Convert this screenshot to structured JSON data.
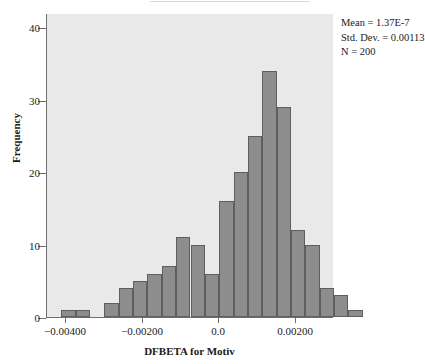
{
  "figure": {
    "top_fragment": "",
    "stats": {
      "mean": "Mean = 1.37E-7",
      "std_dev": "Std. Dev. = 0.00113",
      "n": "N = 200"
    }
  },
  "chart_data": {
    "type": "bar",
    "title": "",
    "subtitle": "",
    "xlabel": "DFBETA for Motiv",
    "ylabel": "Frequency",
    "grid": false,
    "legend": null,
    "plot_background": "#e9e9e9",
    "bar_fill": "#8d8d8d",
    "bar_border": "#5e5e5e",
    "xlim": [
      -0.0045,
      0.003
    ],
    "ylim": [
      0,
      42
    ],
    "xticks": [
      -0.004,
      -0.002,
      0.0,
      0.002
    ],
    "xtick_labels": [
      "−0.00400",
      "−0.00200",
      "0.0",
      "0.00200"
    ],
    "yticks": [
      0,
      10,
      20,
      30,
      40
    ],
    "ytick_labels": [
      "0",
      "10",
      "20",
      "30",
      "40"
    ],
    "bin_width": 0.000375,
    "bin_starts": [
      -0.004125,
      -0.00375,
      -0.003375,
      -0.003,
      -0.002625,
      -0.00225,
      -0.001875,
      -0.0015,
      -0.001125,
      -0.00075,
      -0.000375,
      0.0,
      0.000375,
      0.00075,
      0.001125,
      0.0015,
      0.001875,
      0.00225,
      0.002625,
      0.003,
      0.003375
    ],
    "categories": [
      "-0.00413",
      "-0.00375",
      "-0.00338",
      "-0.00300",
      "-0.00263",
      "-0.00225",
      "-0.00188",
      "-0.00150",
      "-0.00113",
      "-0.00075",
      "-0.00038",
      "0.00000",
      "0.00038",
      "0.00075",
      "0.00113",
      "0.00150",
      "0.00188",
      "0.00225",
      "0.00263",
      "0.00300",
      "0.00338"
    ],
    "values": [
      1,
      1,
      0,
      2,
      4,
      5,
      6,
      7,
      11,
      10,
      6,
      16,
      20,
      25,
      34,
      29,
      12,
      10,
      4,
      3,
      1
    ],
    "annotations": [
      "Mean = 1.37E-7",
      "Std. Dev. = 0.00113",
      "N = 200"
    ]
  }
}
